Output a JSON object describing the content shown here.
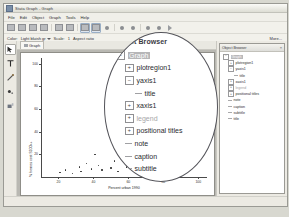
{
  "window": {
    "title": "Stata Graph - Graph",
    "app_icon": "stata-icon"
  },
  "menubar": {
    "items": [
      "File",
      "Edit",
      "Object",
      "Graph",
      "Tools",
      "Help"
    ]
  },
  "toolbar": {
    "buttons": [
      {
        "name": "new-icon"
      },
      {
        "name": "open-icon"
      },
      {
        "name": "save-icon"
      },
      {
        "name": "print-icon"
      },
      {
        "name": "copy-icon"
      },
      {
        "name": "paste-icon"
      },
      {
        "name": "grid-icon",
        "selected": true
      },
      {
        "name": "snap-icon",
        "selected": true
      },
      {
        "name": "add-text-icon"
      },
      {
        "name": "undo-icon"
      },
      {
        "name": "redo-icon"
      },
      {
        "name": "record-icon"
      },
      {
        "name": "pause-icon"
      },
      {
        "name": "play-icon"
      }
    ]
  },
  "optionbar": {
    "color_label": "Color:",
    "color_value": "Light bluish gr",
    "scale_label": "Scale:",
    "scale_value": "1",
    "aspect_label": "Aspect ratio",
    "more_label": "More..."
  },
  "lefttools": {
    "items": [
      {
        "name": "pointer-tool",
        "label": "Select",
        "active": true
      },
      {
        "name": "text-tool",
        "label": "Text"
      },
      {
        "name": "line-tool",
        "label": "Line"
      },
      {
        "name": "marker-tool",
        "label": "Marker"
      },
      {
        "name": "paint-tool",
        "label": "Paint"
      }
    ]
  },
  "tabs": {
    "items": [
      {
        "label": "Graph",
        "icon": "graph-tab-icon",
        "active": true
      }
    ]
  },
  "object_browser": {
    "title": "Object Browser",
    "close_label": "×",
    "nodes": [
      {
        "label": "Graph",
        "indent": 0,
        "type": "expanded",
        "selected": true,
        "dim": false
      },
      {
        "label": "plotregion1",
        "indent": 1,
        "type": "collapsed",
        "selected": false,
        "dim": false
      },
      {
        "label": "yaxis1",
        "indent": 1,
        "type": "expanded",
        "selected": false,
        "dim": false
      },
      {
        "label": "title",
        "indent": 2,
        "type": "leaf",
        "selected": false,
        "dim": false
      },
      {
        "label": "xaxis1",
        "indent": 1,
        "type": "collapsed",
        "selected": false,
        "dim": false
      },
      {
        "label": "legend",
        "indent": 1,
        "type": "collapsed",
        "selected": false,
        "dim": true
      },
      {
        "label": "positional titles",
        "indent": 1,
        "type": "collapsed",
        "selected": false,
        "dim": false
      },
      {
        "label": "note",
        "indent": 1,
        "type": "leaf",
        "selected": false,
        "dim": false
      },
      {
        "label": "caption",
        "indent": 1,
        "type": "leaf",
        "selected": false,
        "dim": false
      },
      {
        "label": "subtitle",
        "indent": 1,
        "type": "leaf",
        "selected": false,
        "dim": false
      },
      {
        "label": "title",
        "indent": 1,
        "type": "leaf",
        "selected": false,
        "dim": false
      }
    ]
  },
  "callout": {
    "title": "Object Browser",
    "highlight_color": "#b6b6b8"
  },
  "chart_data": {
    "type": "scatter",
    "title": "",
    "xlabel": "Percent urban 1990",
    "ylabel": "% homes cost $100k+",
    "xlim": [
      10,
      105
    ],
    "ylim": [
      0,
      105
    ],
    "xticks": [
      20,
      40,
      60,
      80,
      100
    ],
    "yticks": [
      20,
      40,
      60,
      80,
      100
    ],
    "grid": false,
    "legend": "none",
    "points": [
      {
        "x": 21,
        "y": 4
      },
      {
        "x": 24,
        "y": 6
      },
      {
        "x": 28,
        "y": 3
      },
      {
        "x": 32,
        "y": 9
      },
      {
        "x": 33,
        "y": 5
      },
      {
        "x": 36,
        "y": 12
      },
      {
        "x": 39,
        "y": 7
      },
      {
        "x": 41,
        "y": 20
      },
      {
        "x": 43,
        "y": 10
      },
      {
        "x": 45,
        "y": 6
      },
      {
        "x": 48,
        "y": 41
      },
      {
        "x": 50,
        "y": 8
      },
      {
        "x": 52,
        "y": 14
      },
      {
        "x": 54,
        "y": 5
      },
      {
        "x": 57,
        "y": 18
      },
      {
        "x": 59,
        "y": 9
      },
      {
        "x": 61,
        "y": 26
      },
      {
        "x": 63,
        "y": 11
      },
      {
        "x": 65,
        "y": 7
      },
      {
        "x": 66,
        "y": 31
      },
      {
        "x": 68,
        "y": 16
      },
      {
        "x": 70,
        "y": 13
      },
      {
        "x": 72,
        "y": 22
      },
      {
        "x": 74,
        "y": 9
      },
      {
        "x": 76,
        "y": 38
      },
      {
        "x": 78,
        "y": 17
      },
      {
        "x": 80,
        "y": 12
      },
      {
        "x": 82,
        "y": 45
      },
      {
        "x": 84,
        "y": 24
      },
      {
        "x": 86,
        "y": 15
      },
      {
        "x": 88,
        "y": 33
      },
      {
        "x": 90,
        "y": 19
      },
      {
        "x": 92,
        "y": 52
      },
      {
        "x": 94,
        "y": 28
      },
      {
        "x": 96,
        "y": 21
      },
      {
        "x": 98,
        "y": 62
      },
      {
        "x": 100,
        "y": 35
      },
      {
        "x": 101,
        "y": 47
      },
      {
        "x": 103,
        "y": 63
      }
    ],
    "highlighted_point": {
      "x": 62,
      "y": 56
    }
  }
}
